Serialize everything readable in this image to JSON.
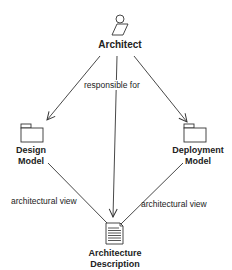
{
  "nodes": {
    "architect": {
      "label": "Architect",
      "icon": "actor-icon"
    },
    "design_model": {
      "label_line1": "Design",
      "label_line2": "Model",
      "icon": "folder-icon"
    },
    "deployment_model": {
      "label_line1": "Deployment",
      "label_line2": "Model",
      "icon": "folder-icon"
    },
    "architecture_description": {
      "label_line1": "Architecture",
      "label_line2": "Description",
      "icon": "document-icon"
    }
  },
  "edges": {
    "responsible_for": "responsible for",
    "architectural_view_left": "architectural view",
    "architectural_view_right": "architectural view"
  },
  "colors": {
    "line": "#333333",
    "text": "#222222"
  }
}
